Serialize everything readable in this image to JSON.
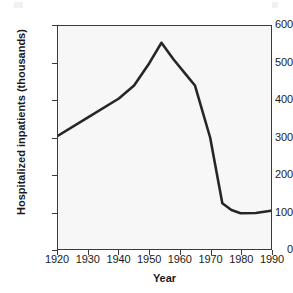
{
  "chart_data": {
    "type": "line",
    "title": "",
    "xlabel": "Year",
    "ylabel": "Hospitalized inpatients (thousands)",
    "xlim": [
      1920,
      1990
    ],
    "ylim": [
      0,
      600
    ],
    "xticks": [
      1920,
      1930,
      1940,
      1950,
      1960,
      1970,
      1980,
      1990
    ],
    "xtick_labels": [
      "1920",
      "1930",
      "1940",
      "1950",
      "1960",
      "1970",
      "1980",
      "1990"
    ],
    "yticks": [
      0,
      100,
      200,
      300,
      400,
      500,
      600
    ],
    "ytick_labels": [
      "0",
      "100",
      "200",
      "300",
      "400",
      "500",
      "600"
    ],
    "grid": false,
    "legend": null,
    "series": [
      {
        "name": "Hospitalized inpatients",
        "color": "#262626",
        "x": [
          1920,
          1930,
          1940,
          1945,
          1950,
          1954,
          1958,
          1962,
          1965,
          1970,
          1974,
          1977,
          1980,
          1985,
          1990
        ],
        "values": [
          305,
          355,
          405,
          440,
          500,
          555,
          510,
          470,
          440,
          300,
          123,
          105,
          96,
          97,
          103
        ]
      }
    ]
  },
  "axes": {
    "y_title": "Hospitalized inpatients (thousands)",
    "x_title": "Year"
  },
  "style": {
    "line_color": "#262626",
    "frame_color": "#3a3a3a",
    "plot_background": "#f7f7f7",
    "figure_background": "#ffffff"
  }
}
